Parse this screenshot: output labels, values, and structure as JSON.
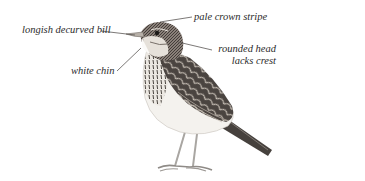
{
  "diagram": {
    "annotations": [
      {
        "id": "bill",
        "text": "longish decurved bill"
      },
      {
        "id": "crown",
        "text": "pale crown stripe"
      },
      {
        "id": "head_line1",
        "text": "rounded head"
      },
      {
        "id": "head_line2",
        "text": "lacks crest"
      },
      {
        "id": "chin",
        "text": "white chin"
      }
    ],
    "colors": {
      "background": "#ffffff",
      "ink": "#2b2b2b",
      "plumage_dark": "#3a3633",
      "plumage_mid": "#7a716a",
      "plumage_light": "#d8d2ca",
      "belly": "#f4f2ee",
      "legs": "#a9a6a2"
    }
  }
}
